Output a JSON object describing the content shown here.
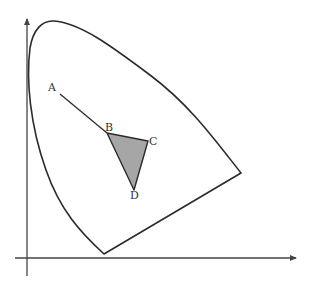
{
  "diagram": {
    "type": "chromaticity-gamut-diagram",
    "colors": {
      "line": "#2b2b2b",
      "axis": "#444444",
      "triangle_fill": "#a6a6a6",
      "background": "#ffffff"
    },
    "points": [
      {
        "label": "A"
      },
      {
        "label": "B"
      },
      {
        "label": "C"
      },
      {
        "label": "D"
      }
    ],
    "elements": {
      "horseshoe_curve": "spectral locus boundary",
      "segment_AB": "line from A to B",
      "triangle_BCD": "shaded gamut triangle"
    }
  }
}
